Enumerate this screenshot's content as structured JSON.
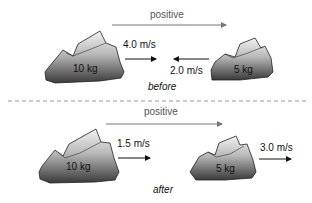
{
  "before": {
    "direction_label": "positive",
    "big_rock": {
      "mass": "10 kg",
      "velocity": "4.0 m/s"
    },
    "small_rock": {
      "mass": "5 kg",
      "velocity": "2.0 m/s"
    },
    "caption": "before"
  },
  "after": {
    "direction_label": "positive",
    "big_rock": {
      "mass": "10 kg",
      "velocity": "1.5 m/s"
    },
    "small_rock": {
      "mass": "5 kg",
      "velocity": "3.0 m/s"
    },
    "caption": "after"
  }
}
